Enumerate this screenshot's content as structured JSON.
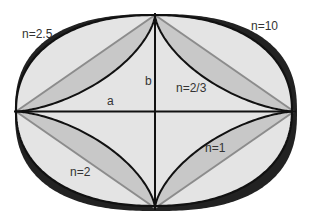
{
  "geometry": {
    "cx": 155,
    "cy": 111.5,
    "a": 139,
    "b": 96.5
  },
  "colors": {
    "background": "#ffffff",
    "outer_band": "#222222",
    "light_fill": "#e4e4e4",
    "mid_fill": "#c8c8c8",
    "stroke": "#111111",
    "diagonal": "#8c8c8c",
    "label": "#333333"
  },
  "curves": [
    {
      "n": 10,
      "role": "outer-band-top-right"
    },
    {
      "n": 2.5,
      "role": "outer-band"
    },
    {
      "n": 2,
      "role": "ellipse"
    },
    {
      "n": 1,
      "role": "diamond"
    },
    {
      "n": 0.6667,
      "role": "astroid"
    }
  ],
  "labels": {
    "n_2_5": "n=2.5",
    "n_10": "n=10",
    "n_2_3": "n=2/3",
    "n_2": "n=2",
    "n_1": "n=1",
    "a": "a",
    "b": "b"
  }
}
